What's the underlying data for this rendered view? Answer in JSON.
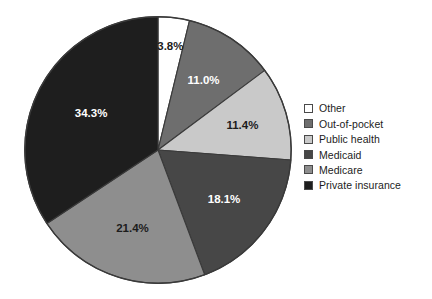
{
  "chart_data": {
    "type": "pie",
    "title": "",
    "subtitle": "",
    "xlabel": "",
    "ylabel": "",
    "legend_position": "right",
    "grid": false,
    "start_angle_deg": 0,
    "direction": "clockwise",
    "total": 100.0,
    "categories": [
      "Other",
      "Out-of-pocket",
      "Public health",
      "Medicaid",
      "Medicare",
      "Private insurance"
    ],
    "values": [
      3.8,
      11.0,
      11.4,
      18.1,
      21.4,
      34.3
    ],
    "labels": [
      "3.8%",
      "11.0%",
      "11.4%",
      "18.1%",
      "21.4%",
      "34.3%"
    ],
    "colors": [
      "#ffffff",
      "#6e6e6e",
      "#c9c9c9",
      "#474747",
      "#8e8e8e",
      "#1e1e1e"
    ],
    "label_colors": [
      "#1c1c1c",
      "#ffffff",
      "#1c1c1c",
      "#ffffff",
      "#1c1c1c",
      "#ffffff"
    ],
    "slices": [
      {
        "name": "Other",
        "value": 3.8,
        "label": "3.8%",
        "color": "#ffffff",
        "label_color": "#1c1c1c"
      },
      {
        "name": "Out-of-pocket",
        "value": 11.0,
        "label": "11.0%",
        "color": "#6e6e6e",
        "label_color": "#ffffff"
      },
      {
        "name": "Public health",
        "value": 11.4,
        "label": "11.4%",
        "color": "#c9c9c9",
        "label_color": "#1c1c1c"
      },
      {
        "name": "Medicaid",
        "value": 18.1,
        "label": "18.1%",
        "color": "#474747",
        "label_color": "#ffffff"
      },
      {
        "name": "Medicare",
        "value": 21.4,
        "label": "21.4%",
        "color": "#8e8e8e",
        "label_color": "#1c1c1c"
      },
      {
        "name": "Private insurance",
        "value": 34.3,
        "label": "34.3%",
        "color": "#1e1e1e",
        "label_color": "#ffffff"
      }
    ]
  },
  "legend": {
    "items": [
      {
        "label": "Other",
        "color": "#ffffff"
      },
      {
        "label": "Out-of-pocket",
        "color": "#6e6e6e"
      },
      {
        "label": "Public health",
        "color": "#c9c9c9"
      },
      {
        "label": "Medicaid",
        "color": "#474747"
      },
      {
        "label": "Medicare",
        "color": "#8e8e8e"
      },
      {
        "label": "Private insurance",
        "color": "#1e1e1e"
      }
    ]
  },
  "style": {
    "pie_outline": "#3a3a3a",
    "background": "#ffffff"
  }
}
